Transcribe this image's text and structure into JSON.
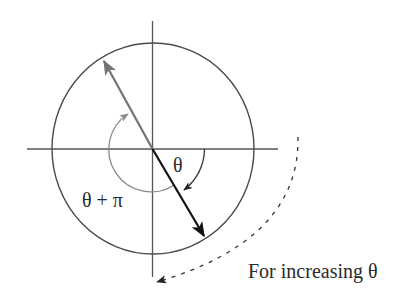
{
  "diagram": {
    "type": "polar-angle-illustration",
    "labels": {
      "theta": "θ",
      "theta_plus_pi": "θ + π",
      "direction_note": "For increasing θ"
    },
    "elements": {
      "circle": {
        "cx": 153,
        "cy": 148.5,
        "rx": 101,
        "ry": 105.5
      },
      "horizontal_axis": {
        "x1": 27,
        "y1": 149,
        "x2": 278,
        "y2": 149
      },
      "vertical_axis": {
        "x1": 152.5,
        "y1": 21,
        "x2": 152.5,
        "y2": 277
      },
      "vector_theta": {
        "from": [
          152.5,
          149
        ],
        "to": [
          205,
          237
        ],
        "color": "#111111"
      },
      "vector_theta_plus_pi": {
        "from": [
          152.5,
          149
        ],
        "to": [
          103,
          60
        ],
        "color": "#737373"
      },
      "arc_theta": {
        "radius": 52,
        "color": "#333333"
      },
      "arc_theta_plus_pi": {
        "radius": 42,
        "color": "#8a8a8a"
      },
      "direction_arc": {
        "style": "dashed",
        "color": "#333333"
      }
    },
    "colors": {
      "axes": "#4a4a4a",
      "circle": "#4a4a4a",
      "primary_vector": "#111111",
      "secondary_vector": "#737373"
    }
  }
}
